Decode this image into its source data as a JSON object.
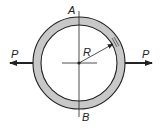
{
  "diagram": {
    "labels": {
      "top": "A",
      "bottom": "B",
      "radius": "R",
      "force_left": "P",
      "force_right": "P"
    },
    "colors": {
      "ring_fill": "#c8c8c8",
      "stroke": "#222222",
      "background": "#ffffff"
    },
    "geometry": {
      "center": [
        79,
        63
      ],
      "outer_radius": 46,
      "inner_radius": 38
    }
  }
}
